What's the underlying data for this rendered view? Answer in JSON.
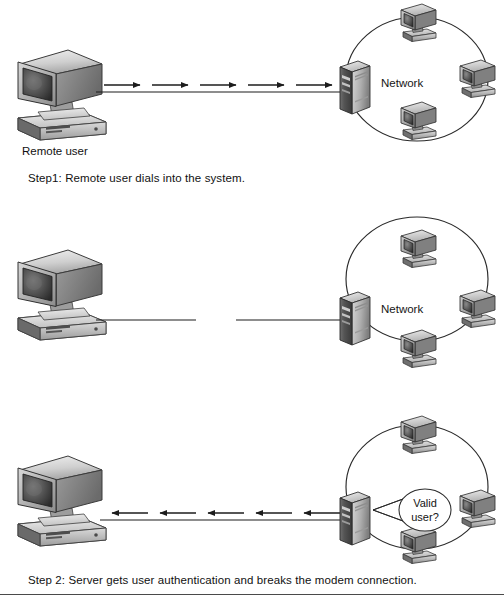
{
  "diagram": {
    "remote_user_label": "Remote user",
    "network_label": "Network",
    "bubble": {
      "line1": "Valid",
      "line2": "user?"
    },
    "colors": {
      "line": "#1c1c1c",
      "ring": "#2a2a2a",
      "text": "#111111",
      "device_light": "#e3e3e3",
      "device_mid": "#b9b9b9",
      "device_dark": "#6f6f6f",
      "device_screen": "#4a4a4a",
      "rule": "#4a4a4a",
      "background": "#ffffff"
    },
    "panels": [
      {
        "id": "step-1",
        "caption": "Step1: Remote user dials into the system.",
        "remote_user_label": "Remote user",
        "network_label": "Network",
        "connection": {
          "style": "arrows-right",
          "arrow_count": 5,
          "direction": "to-server",
          "broken": false
        },
        "ring_clients": 3,
        "has_bubble": false
      },
      {
        "id": "step-2",
        "caption": "Step 2: Server gets user authentication and breaks the modem connection.",
        "remote_user_label": "",
        "network_label": "Network",
        "connection": {
          "style": "broken-line",
          "arrow_count": 0,
          "direction": "none",
          "broken": true
        },
        "ring_clients": 3,
        "has_bubble": false
      },
      {
        "id": "step-3",
        "caption": "Step 3: If the remote user is valid the server calls the user back at a predefined number.",
        "remote_user_label": "",
        "network_label": "",
        "connection": {
          "style": "arrows-left",
          "arrow_count": 5,
          "direction": "to-remote-user",
          "broken": false
        },
        "ring_clients": 3,
        "has_bubble": true,
        "bubble_text": "Valid user?"
      }
    ],
    "icon_names": {
      "remote_user": "desktop-computer-icon",
      "server": "server-tower-icon",
      "client": "client-computer-icon",
      "ring": "network-ring-icon",
      "arrow": "arrow-right-icon",
      "bubble": "thought-bubble-icon"
    }
  }
}
